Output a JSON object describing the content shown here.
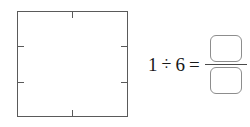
{
  "worksheet": {
    "figure": {
      "shape": "square",
      "edge_ticks": {
        "top": [
          {
            "name": "tick-top-center",
            "position_fraction": 0.5
          }
        ],
        "bottom": [
          {
            "name": "tick-bottom-center",
            "position_fraction": 0.5
          }
        ],
        "left": [
          {
            "name": "tick-left-upper",
            "position_fraction": 0.3333
          },
          {
            "name": "tick-left-lower",
            "position_fraction": 0.6667
          }
        ],
        "right": [
          {
            "name": "tick-right-upper",
            "position_fraction": 0.3333
          },
          {
            "name": "tick-right-lower",
            "position_fraction": 0.6667
          }
        ]
      },
      "outline_color": "#5a5a5a",
      "fill_color": "#ffffff"
    },
    "equation": {
      "dividend": "1",
      "operator": "÷",
      "divisor": "6",
      "equals": "=",
      "answer": {
        "numerator": "",
        "denominator": "",
        "numerator_placeholder": "",
        "denominator_placeholder": "",
        "box_border_color": "#8d8d8d",
        "fraction_bar_color": "#4a4a4a"
      }
    }
  }
}
